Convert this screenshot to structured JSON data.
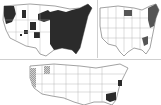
{
  "figure": {
    "type": "composite-choropleth-maps",
    "region": "Contiguous United States",
    "panels": [
      {
        "id": "top-left",
        "shading": "dense",
        "shaded_regions": [
          "eastern US (most states east of the Great Plains)",
          "Pacific Northwest",
          "northern Rockies patches",
          "scattered mountain west areas"
        ],
        "fill_color": "#2b2b2b"
      },
      {
        "id": "top-right",
        "shading": "sparse",
        "shaded_regions": [
          "New England / Northeast coast",
          "upper Great Lakes (Michigan/Wisconsin)",
          "South Carolina / Georgia coast"
        ],
        "fill_color": "#555555"
      },
      {
        "id": "bottom",
        "shading": "sparse",
        "shaded_regions": [
          "California / Oregon coast (light hatched)",
          "eastern Washington / Idaho (light hatched)",
          "Mid-Atlantic coast (Delaware/Maryland)",
          "Georgia / South Carolina (dark)"
        ],
        "fill_color": "#2b2b2b",
        "light_fill_color": "#9a9a9a"
      }
    ],
    "colors": {
      "background": "#ffffff",
      "border": "#8a8a8a",
      "dark_fill": "#2b2b2b",
      "mid_fill": "#555555",
      "light_fill": "#9a9a9a"
    }
  }
}
